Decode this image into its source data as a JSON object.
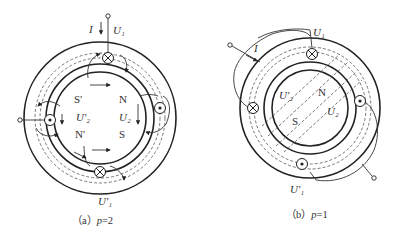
{
  "figure_a": {
    "caption_prefix": "（a）",
    "caption_var": "p",
    "caption_value": "=2",
    "current_label": "I",
    "terminal_top": "U₁",
    "terminal_bottom": "U′₁",
    "rotor_left": "U′₂",
    "rotor_right": "U₂",
    "poles": {
      "top_left": "S′",
      "top_right": "N",
      "bottom_left": "N′",
      "bottom_right": "S"
    },
    "conductors": [
      {
        "position": "top",
        "symbol": "cross"
      },
      {
        "position": "right",
        "symbol": "dot"
      },
      {
        "position": "bottom",
        "symbol": "cross"
      },
      {
        "position": "left",
        "symbol": "dot"
      }
    ]
  },
  "figure_b": {
    "caption_prefix": "（b）",
    "caption_var": "p",
    "caption_value": "=1",
    "current_label": "I",
    "terminal_top": "U₁",
    "terminal_bottom": "U′₁",
    "rotor_left": "U′₂",
    "rotor_right": "U₂",
    "poles": {
      "north": "N",
      "south": "S"
    },
    "conductors": [
      {
        "position": "top",
        "symbol": "cross"
      },
      {
        "position": "left",
        "symbol": "cross"
      },
      {
        "position": "right",
        "symbol": "dot"
      },
      {
        "position": "bottom",
        "symbol": "dot"
      }
    ]
  }
}
